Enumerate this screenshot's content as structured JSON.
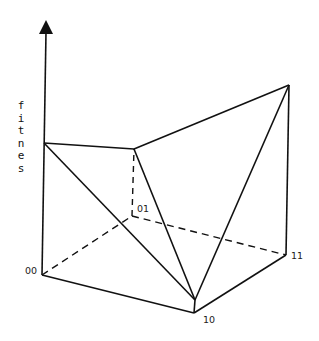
{
  "diagram": {
    "y_axis_label": "fitness",
    "y_axis_letters": [
      "f",
      "i",
      "t",
      "n",
      "e",
      "s",
      "s"
    ],
    "points": [
      {
        "id": "00",
        "label": "00",
        "base": [
          42,
          275
        ],
        "top": [
          44,
          143
        ]
      },
      {
        "id": "01",
        "label": "01",
        "base": [
          132,
          216
        ],
        "top": [
          134,
          149
        ]
      },
      {
        "id": "10",
        "label": "10",
        "base": [
          194,
          313
        ],
        "top": [
          195,
          300
        ]
      },
      {
        "id": "11",
        "label": "11",
        "base": [
          286,
          255
        ],
        "top": [
          289,
          85
        ]
      }
    ],
    "colors": {
      "line": "#111111",
      "background": "#ffffff"
    }
  }
}
